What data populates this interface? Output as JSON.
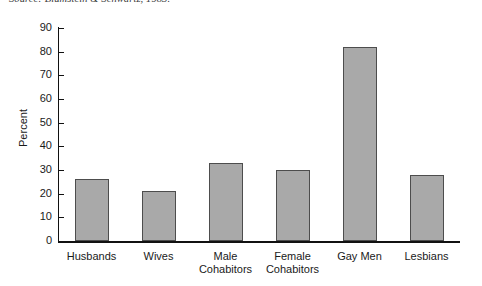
{
  "source_note": "Source: Blumstein & Schwartz, 1983.",
  "chart_data": {
    "type": "bar",
    "title": "",
    "xlabel": "",
    "ylabel": "Percent",
    "ylim": [
      0,
      90
    ],
    "yticks": [
      0,
      10,
      20,
      30,
      40,
      50,
      60,
      70,
      80,
      90
    ],
    "grid": false,
    "legend": false,
    "bar_fill_color": "#a9a9a9",
    "bar_edge_color": "#4d4d4d",
    "axis_color": "#111111",
    "background_color": "#ffffff",
    "categories": [
      "Husbands",
      "Wives",
      "Male\nCohabitors",
      "Female\nCohabitors",
      "Gay Men",
      "Lesbians"
    ],
    "values": [
      26,
      21,
      33,
      30,
      82,
      28
    ]
  }
}
